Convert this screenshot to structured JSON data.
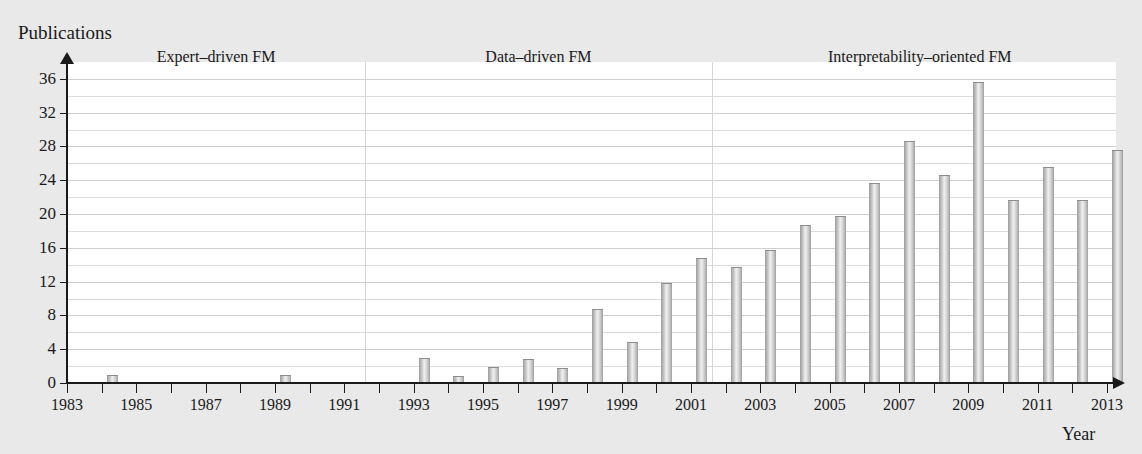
{
  "figure": {
    "y_axis_title": "Publications",
    "x_axis_title": "Year"
  },
  "chart_data": {
    "type": "bar",
    "title": "",
    "xlabel": "Year",
    "ylabel": "Publications",
    "xlim": [
      1983,
      2013
    ],
    "ylim": [
      0,
      38
    ],
    "yticks": [
      0,
      4,
      8,
      12,
      16,
      20,
      24,
      28,
      32,
      36
    ],
    "ytick_labels": [
      "0",
      "4",
      "8",
      "12",
      "16",
      "20",
      "24",
      "28",
      "32",
      "36"
    ],
    "gridline_step": 2,
    "grid": true,
    "legend": "none",
    "xticks": [
      1983,
      1984,
      1985,
      1986,
      1987,
      1988,
      1989,
      1990,
      1991,
      1992,
      1993,
      1994,
      1995,
      1996,
      1997,
      1998,
      1999,
      2000,
      2001,
      2002,
      2003,
      2004,
      2005,
      2006,
      2007,
      2008,
      2009,
      2010,
      2011,
      2012,
      2013
    ],
    "xtick_labels_shown": [
      "1983",
      "1985",
      "1987",
      "1989",
      "1991",
      "1993",
      "1995",
      "1997",
      "1999",
      "2001",
      "2003",
      "2005",
      "2007",
      "2009",
      "2011",
      "2013"
    ],
    "categories": [
      1983,
      1984,
      1985,
      1986,
      1987,
      1988,
      1989,
      1990,
      1991,
      1992,
      1993,
      1994,
      1995,
      1996,
      1997,
      1998,
      1999,
      2000,
      2001,
      2002,
      2003,
      2004,
      2005,
      2006,
      2007,
      2008,
      2009,
      2010,
      2011,
      2012,
      2013
    ],
    "values": [
      0,
      1,
      0,
      0,
      0,
      0,
      1,
      0,
      0,
      0,
      3,
      0.8,
      1.9,
      2.8,
      1.8,
      8.8,
      4.8,
      11.8,
      14.8,
      13.7,
      15.8,
      18.7,
      19.8,
      23.7,
      28.6,
      24.6,
      35.6,
      21.7,
      25.6,
      21.7,
      27.6
    ],
    "annotations": [
      {
        "label": "Expert–driven FM",
        "start_year": 1983,
        "end_year": 1991.6
      },
      {
        "label": "Data–driven FM",
        "start_year": 1991.6,
        "end_year": 2001.6
      },
      {
        "label": "Interpretability–oriented FM",
        "start_year": 2001.6,
        "end_year": 2013.6
      }
    ],
    "dividers": [
      1991.6,
      2001.6
    ],
    "colors": {
      "bar_fill_light": "#efefef",
      "bar_fill_dark": "#9b9b9b",
      "axis": "#1a1a1a",
      "gridline": "#dcdcdc",
      "plot_background": "#ffffff",
      "page_background": "#e9e9e9"
    }
  }
}
